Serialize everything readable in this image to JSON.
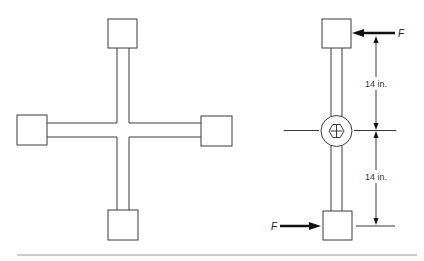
{
  "figure": {
    "left_view": {
      "name": "cross-wrench-plan-view"
    },
    "right_view": {
      "name": "wrench-side-view-with-forces",
      "force_top_label": "F",
      "force_bottom_label": "F",
      "dimension_upper": "14 in.",
      "dimension_lower": "14 in."
    }
  },
  "colors": {
    "line": "#3a3a3a",
    "rule": "#9a9a9a",
    "arrow": "#111111"
  }
}
